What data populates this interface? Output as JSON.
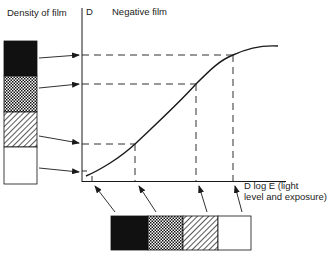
{
  "labels": {
    "density_of_film": "Density of film",
    "y_axis": "D",
    "title": "Negative film",
    "x_axis_line1": "D log E (light",
    "x_axis_line2": "level and exposure)"
  },
  "left_strip": {
    "segments": [
      {
        "pattern": "solid-black"
      },
      {
        "pattern": "checker"
      },
      {
        "pattern": "diagonal-hatch"
      },
      {
        "pattern": "white"
      }
    ]
  },
  "bottom_strip": {
    "segments": [
      {
        "pattern": "solid-black"
      },
      {
        "pattern": "checker"
      },
      {
        "pattern": "diagonal-hatch"
      },
      {
        "pattern": "white"
      }
    ]
  },
  "curve": {
    "description": "Characteristic (H&D) curve of negative film: density rises with log exposure, S-shaped, flattening at top",
    "marked_points": 4
  },
  "colors": {
    "ink": "#1a1a1a",
    "background": "#ffffff"
  }
}
